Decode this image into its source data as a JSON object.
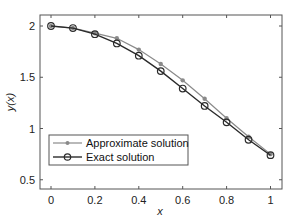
{
  "chart_data": {
    "type": "line",
    "title": "",
    "xlabel": "x",
    "ylabel": "y(x)",
    "xlim": [
      -0.05,
      1.05
    ],
    "ylim": [
      0.41,
      2.11
    ],
    "x_ticks": [
      0,
      0.2,
      0.4,
      0.6,
      0.8,
      1
    ],
    "x_tick_labels": [
      "0",
      "0.2",
      "0.4",
      "0.6",
      "0.8",
      "1"
    ],
    "y_ticks": [
      0.5,
      1,
      1.5,
      2
    ],
    "y_tick_labels": [
      "0.5",
      "1",
      "1.5",
      "2"
    ],
    "grid": false,
    "legend_position": "lower left",
    "x": [
      0,
      0.1,
      0.2,
      0.3,
      0.4,
      0.5,
      0.6,
      0.7,
      0.8,
      0.9,
      1.0
    ],
    "series": [
      {
        "name": "Approximate solution",
        "marker": "asterisk",
        "color": "#8a8a8a",
        "values": [
          2.0,
          1.98,
          1.93,
          1.88,
          1.77,
          1.63,
          1.47,
          1.29,
          1.1,
          0.92,
          0.75
        ]
      },
      {
        "name": "Exact solution",
        "marker": "circle",
        "color": "#2b2b2b",
        "values": [
          2.0,
          1.98,
          1.92,
          1.83,
          1.71,
          1.56,
          1.39,
          1.22,
          1.06,
          0.89,
          0.74
        ]
      }
    ]
  },
  "legend": {
    "approx_label": "Approximate solution",
    "exact_label": "Exact solution"
  },
  "axes": {
    "xlabel": "x",
    "ylabel": "y(x)"
  }
}
